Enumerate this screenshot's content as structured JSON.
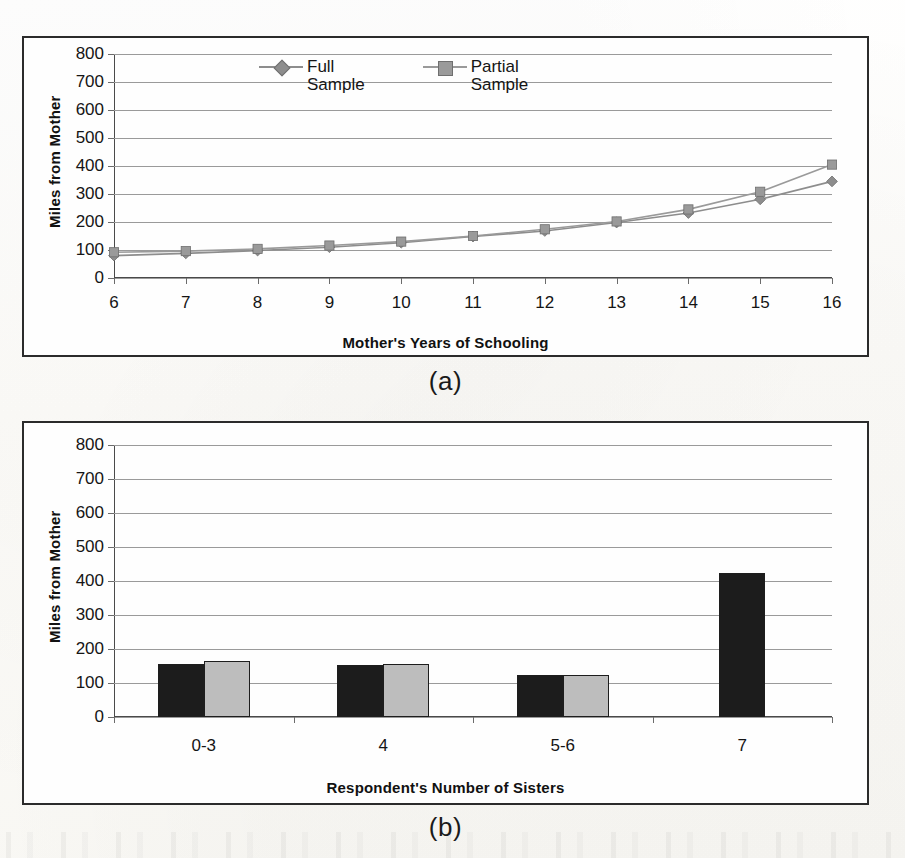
{
  "figure": {
    "caption_a": "(a)",
    "caption_b": "(b)"
  },
  "chart_data": [
    {
      "panel": "a",
      "type": "line",
      "title": "",
      "xlabel": "Mother's Years of Schooling",
      "ylabel": "Miles from Mother",
      "x": [
        6,
        7,
        8,
        9,
        10,
        11,
        12,
        13,
        14,
        15,
        16
      ],
      "xticklabels": [
        "6",
        "7",
        "8",
        "9",
        "10",
        "11",
        "12",
        "13",
        "14",
        "15",
        "16"
      ],
      "yticks": [
        0,
        100,
        200,
        300,
        400,
        500,
        600,
        700,
        800
      ],
      "yticklabels": [
        "0",
        "100",
        "200",
        "300",
        "400",
        "500",
        "600",
        "700",
        "800"
      ],
      "ylim": [
        0,
        800
      ],
      "grid": true,
      "legend_position": "top-center",
      "series": [
        {
          "name": "Full Sample",
          "label_lines": [
            "Full",
            "Sample"
          ],
          "marker": "diamond",
          "color": "#8d8d8d",
          "values": [
            80,
            88,
            98,
            110,
            126,
            148,
            168,
            198,
            232,
            281,
            345
          ]
        },
        {
          "name": "Partial Sample",
          "label_lines": [
            "Partial",
            "Sample"
          ],
          "marker": "square",
          "color": "#9a9a9a",
          "values": [
            92,
            96,
            104,
            116,
            130,
            150,
            174,
            202,
            245,
            308,
            405
          ]
        }
      ]
    },
    {
      "panel": "b",
      "type": "bar",
      "title": "",
      "xlabel": "Respondent's Number of Sisters",
      "ylabel": "Miles from Mother",
      "categories": [
        "0-3",
        "4",
        "5-6",
        "7"
      ],
      "yticks": [
        0,
        100,
        200,
        300,
        400,
        500,
        600,
        700,
        800
      ],
      "yticklabels": [
        "0",
        "100",
        "200",
        "300",
        "400",
        "500",
        "600",
        "700",
        "800"
      ],
      "ylim": [
        0,
        800
      ],
      "grid": true,
      "series": [
        {
          "name": "Full Sample",
          "color": "#1c1c1c",
          "values": [
            155,
            153,
            124,
            425
          ]
        },
        {
          "name": "Partial Sample",
          "color": "#bdbdbd",
          "values": [
            166,
            157,
            125,
            null
          ]
        }
      ]
    }
  ]
}
